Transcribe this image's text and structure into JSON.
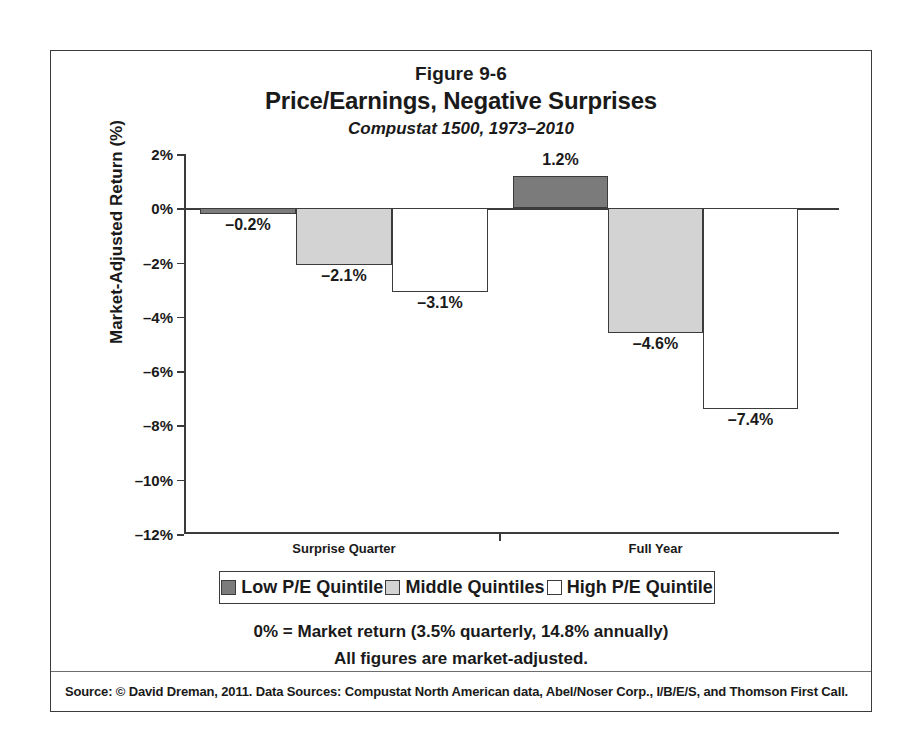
{
  "figure": {
    "number": "Figure 9-6",
    "title": "Price/Earnings, Negative Surprises",
    "subtitle": "Compustat 1500, 1973–2010"
  },
  "notes": {
    "line1": "0% = Market return (3.5% quarterly, 14.8% annually)",
    "line2": "All figures are market-adjusted."
  },
  "source": {
    "text": "Source: © David Dreman, 2011. Data Sources: Compustat North American data, Abel/Noser Corp., I/B/E/S, and Thomson First Call."
  },
  "colors": {
    "low": "#7b7b7b",
    "middle": "#d3d3d3",
    "high": "#ffffff",
    "ink": "#3b3b3b"
  },
  "chart_data": {
    "type": "bar",
    "title": "Price/Earnings, Negative Surprises",
    "subtitle": "Compustat 1500, 1973–2010",
    "xlabel": "",
    "ylabel": "Market-Adjusted Return (%)",
    "ylim": [
      -12,
      2
    ],
    "yticks": [
      2,
      0,
      -2,
      -4,
      -6,
      -8,
      -10,
      -12
    ],
    "ytick_labels": [
      "2%",
      "0%",
      "–2%",
      "–4%",
      "–6%",
      "–8%",
      "–10%",
      "–12%"
    ],
    "grid": false,
    "legend_position": "bottom",
    "categories": [
      "Surprise Quarter",
      "Full Year"
    ],
    "series": [
      {
        "name": "Low P/E Quintile",
        "color": "#7b7b7b",
        "values": [
          -0.2,
          1.2
        ],
        "labels": [
          "–0.2%",
          "1.2%"
        ]
      },
      {
        "name": "Middle Quintiles",
        "color": "#d3d3d3",
        "values": [
          -2.1,
          -4.6
        ],
        "labels": [
          "–2.1%",
          "–4.6%"
        ]
      },
      {
        "name": "High P/E Quintile",
        "color": "#ffffff",
        "values": [
          -3.1,
          -7.4
        ],
        "labels": [
          "–3.1%",
          "–7.4%"
        ]
      }
    ]
  }
}
